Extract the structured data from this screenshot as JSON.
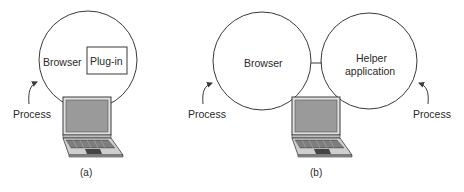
{
  "panels": [
    {
      "id": "a",
      "caption": "(a)",
      "circle_label": "Browser",
      "box_label": "Plug-in",
      "process_label": "Process"
    },
    {
      "id": "b",
      "caption": "(b)",
      "browser_label": "Browser",
      "helper_label_line1": "Helper",
      "helper_label_line2": "application",
      "process_left_label": "Process",
      "process_right_label": "Process"
    }
  ],
  "colors": {
    "line": "#3a3a3a",
    "laptop_screen": "#9a9a9a",
    "laptop_body": "#c8c8c8",
    "laptop_dark": "#555555"
  }
}
